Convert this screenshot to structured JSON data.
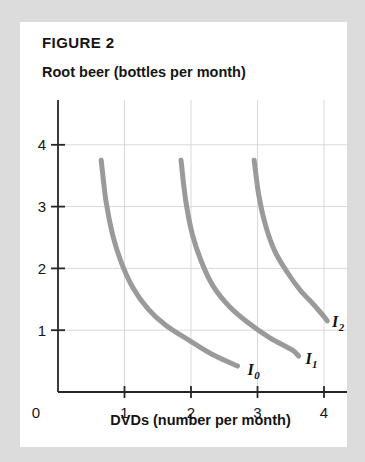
{
  "figure": {
    "title": "FIGURE 2",
    "y_axis_title": "Root beer (bottles per month)",
    "x_axis_title": "DVDs (number per month)",
    "origin_label": "0"
  },
  "colors": {
    "background": "#dcdcdc",
    "card": "#ffffff",
    "axis": "#262626",
    "grid": "#d9d9d9",
    "curve": "#9a9a9a",
    "text": "#151515"
  },
  "chart_data": {
    "type": "line",
    "title": "FIGURE 2",
    "subtitle": "Root beer (bottles per month)",
    "xlabel": "DVDs (number per month)",
    "ylabel": "Root beer (bottles per month)",
    "xlim": [
      0,
      4.35
    ],
    "ylim": [
      0,
      4.35
    ],
    "xticks": [
      0,
      1,
      2,
      3,
      4
    ],
    "xtick_labels": [
      "0",
      "1",
      "2",
      "3",
      "4"
    ],
    "yticks": [
      0,
      1,
      2,
      3,
      4
    ],
    "ytick_labels": [
      "0",
      "1",
      "2",
      "3",
      "4"
    ],
    "grid": true,
    "grid_axes": "both",
    "legend": "inline-annotations",
    "series": [
      {
        "name": "I0",
        "label": "I",
        "label_sub": "0",
        "label_at": [
          2.85,
          0.28
        ],
        "points": [
          [
            0.65,
            3.75
          ],
          [
            0.72,
            3.1
          ],
          [
            0.82,
            2.55
          ],
          [
            0.95,
            2.1
          ],
          [
            1.12,
            1.7
          ],
          [
            1.35,
            1.35
          ],
          [
            1.62,
            1.08
          ],
          [
            1.95,
            0.85
          ],
          [
            2.3,
            0.62
          ],
          [
            2.7,
            0.42
          ]
        ]
      },
      {
        "name": "I1",
        "label": "I",
        "label_sub": "1",
        "label_at": [
          3.72,
          0.45
        ],
        "points": [
          [
            1.85,
            3.75
          ],
          [
            1.92,
            3.1
          ],
          [
            2.02,
            2.55
          ],
          [
            2.16,
            2.1
          ],
          [
            2.34,
            1.7
          ],
          [
            2.58,
            1.38
          ],
          [
            2.86,
            1.12
          ],
          [
            3.18,
            0.88
          ],
          [
            3.52,
            0.68
          ],
          [
            3.62,
            0.58
          ]
        ]
      },
      {
        "name": "I2",
        "label": "I",
        "label_sub": "2",
        "label_at": [
          4.12,
          1.05
        ],
        "points": [
          [
            2.95,
            3.75
          ],
          [
            3.02,
            3.18
          ],
          [
            3.12,
            2.7
          ],
          [
            3.26,
            2.28
          ],
          [
            3.44,
            1.95
          ],
          [
            3.64,
            1.65
          ],
          [
            3.84,
            1.42
          ],
          [
            4.0,
            1.22
          ],
          [
            4.05,
            1.15
          ]
        ]
      }
    ]
  }
}
